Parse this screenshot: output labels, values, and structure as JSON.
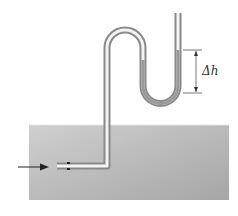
{
  "figure": {
    "type": "pitot-tube-manometer",
    "label_delta_h": "Δh",
    "top_text_cut": "",
    "colors": {
      "water_top": "#c8c8c8",
      "water_bottom": "#a9a9a9",
      "tube_outer": "#8a8a8a",
      "tube_inner": "#f4f4f4",
      "liquid": "#9a9a9a",
      "arrow": "#222222",
      "dimension": "#555555"
    }
  }
}
